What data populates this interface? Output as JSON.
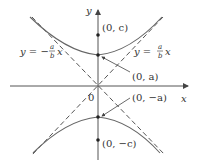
{
  "diagram": {
    "type": "hyperbola-vertical",
    "axes": {
      "x_label": "x",
      "y_label": "y",
      "origin_label": "0"
    },
    "points": [
      {
        "id": "focus-top",
        "label": "(0, c)"
      },
      {
        "id": "vertex-top",
        "label": "(0, a)"
      },
      {
        "id": "vertex-bottom",
        "label": "(0, −a)"
      },
      {
        "id": "focus-bottom",
        "label": "(0, −c)"
      }
    ],
    "asymptotes": {
      "left": {
        "lhs": "y = −",
        "num": "a",
        "den": "b",
        "var": "x"
      },
      "right": {
        "lhs": "y = ",
        "num": "a",
        "den": "b",
        "var": "x"
      }
    },
    "colors": {
      "axis": "#555555",
      "curve": "#666666",
      "asymptote": "#555555",
      "text": "#333333"
    }
  }
}
